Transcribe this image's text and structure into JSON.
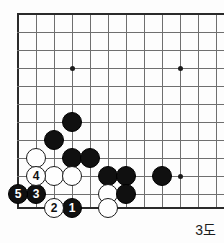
{
  "diagram": {
    "caption": "3도",
    "kind": "go-board-diagram",
    "board": {
      "grid_spacing": 18,
      "origin_x": 18,
      "origin_y": 14,
      "cols": 12,
      "rows": 12,
      "left_edge": true,
      "top_edge": true,
      "bottom_edge": true,
      "right_edge_cropped": true,
      "line_color": "#6f6f6f",
      "edge_color": "#2a2a2a"
    },
    "star_points": [
      {
        "col": 3,
        "row": 3
      },
      {
        "col": 9,
        "row": 3
      },
      {
        "col": 9,
        "row": 9
      }
    ],
    "stones": [
      {
        "color": "black",
        "col": 3,
        "row": 6,
        "label": ""
      },
      {
        "color": "black",
        "col": 2,
        "row": 7,
        "label": ""
      },
      {
        "color": "white",
        "col": 1,
        "row": 8,
        "label": ""
      },
      {
        "color": "black",
        "col": 3,
        "row": 8,
        "label": ""
      },
      {
        "color": "black",
        "col": 4,
        "row": 8,
        "label": ""
      },
      {
        "color": "white",
        "col": 2,
        "row": 9,
        "label": ""
      },
      {
        "color": "white",
        "col": 3,
        "row": 9,
        "label": ""
      },
      {
        "color": "black",
        "col": 5,
        "row": 9,
        "label": ""
      },
      {
        "color": "black",
        "col": 6,
        "row": 9,
        "label": ""
      },
      {
        "color": "black",
        "col": 8,
        "row": 9,
        "label": ""
      },
      {
        "color": "white",
        "col": 5,
        "row": 10,
        "label": ""
      },
      {
        "color": "black",
        "col": 6,
        "row": 10,
        "label": ""
      },
      {
        "color": "white",
        "col": 5,
        "row": 11,
        "label": ""
      }
    ],
    "moves": [
      {
        "order": 1,
        "color": "black",
        "col": 3,
        "row": 11,
        "label": "1"
      },
      {
        "order": 2,
        "color": "white",
        "col": 2,
        "row": 11,
        "label": "2"
      },
      {
        "order": 3,
        "color": "black",
        "col": 1,
        "row": 10,
        "label": "3"
      },
      {
        "order": 4,
        "color": "white",
        "col": 1,
        "row": 9,
        "label": "4"
      },
      {
        "order": 5,
        "color": "black",
        "col": 0,
        "row": 10,
        "label": "5"
      }
    ]
  }
}
